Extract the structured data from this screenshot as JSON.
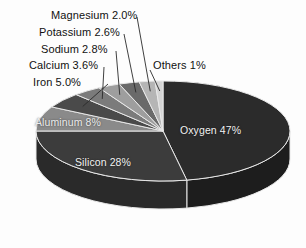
{
  "chart_data": {
    "type": "pie",
    "title": "",
    "subtitle": "",
    "xlabel": "",
    "ylabel": "",
    "legend_position": "none",
    "grid": false,
    "style": "3d-pie",
    "categories": [
      "Oxygen",
      "Silicon",
      "Aluminum",
      "Iron",
      "Calcium",
      "Sodium",
      "Potassium",
      "Magnesium",
      "Others"
    ],
    "values": [
      47,
      28,
      8,
      5.0,
      3.6,
      2.8,
      2.6,
      2.0,
      1
    ],
    "labels": [
      "Oxygen 47%",
      "Silicon 28%",
      "Aluminum 8%",
      "Iron 5.0%",
      "Calcium 3.6%",
      "Sodium 2.8%",
      "Potassium 2.6%",
      "Magnesium 2.0%",
      "Others 1%"
    ],
    "slices": [
      {
        "name": "Oxygen",
        "label": "Oxygen 47%",
        "value": 47,
        "color": "#2b2b2b",
        "side_color": "#1d1d1d",
        "label_placement": "inside"
      },
      {
        "name": "Silicon",
        "label": "Silicon 28%",
        "value": 28,
        "color": "#3c3c3c",
        "side_color": "#2a2a2a",
        "label_placement": "inside"
      },
      {
        "name": "Aluminum",
        "label": "Aluminum 8%",
        "value": 8,
        "color": "#8a8a8a",
        "side_color": "#6d6d6d",
        "label_placement": "inside"
      },
      {
        "name": "Iron",
        "label": "Iron 5.0%",
        "value": 5.0,
        "color": "#4a4a4a",
        "side_color": "#343434",
        "label_placement": "callout"
      },
      {
        "name": "Calcium",
        "label": "Calcium 3.6%",
        "value": 3.6,
        "color": "#7b7b7b",
        "side_color": "#5c5c5c",
        "label_placement": "callout"
      },
      {
        "name": "Sodium",
        "label": "Sodium 2.8%",
        "value": 2.8,
        "color": "#9e9e9e",
        "side_color": "#7a7a7a",
        "label_placement": "callout"
      },
      {
        "name": "Potassium",
        "label": "Potassium 2.6%",
        "value": 2.6,
        "color": "#6a6a6a",
        "side_color": "#505050",
        "label_placement": "callout"
      },
      {
        "name": "Magnesium",
        "label": "Magnesium 2.0%",
        "value": 2.0,
        "color": "#b5b5b5",
        "side_color": "#8d8d8d",
        "label_placement": "callout"
      },
      {
        "name": "Others",
        "label": "Others 1%",
        "value": 1,
        "color": "#d4d4d4",
        "side_color": "#a6a6a6",
        "label_placement": "callout"
      }
    ],
    "background_color": "#fdfdfd",
    "outline_color": "#e8e8e8",
    "total": 100
  }
}
